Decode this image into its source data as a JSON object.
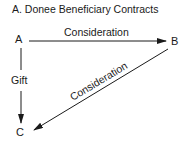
{
  "title": "A. Donee Beneficiary Contracts",
  "nodes": {
    "a": "A",
    "b": "B",
    "c": "C"
  },
  "edges": {
    "a_to_b": "Consideration",
    "a_to_c": "Gift",
    "b_to_c": "Consideration"
  },
  "colors": {
    "stroke": "#1a1a1a",
    "background": "#ffffff"
  }
}
